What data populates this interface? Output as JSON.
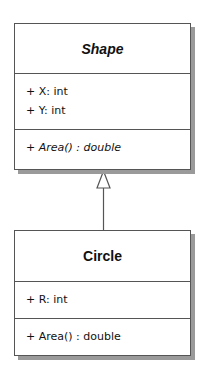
{
  "diagram": {
    "type": "UML class diagram",
    "classes": [
      {
        "name": "Shape",
        "abstract": true,
        "attributes": [
          "+ X: int",
          "+ Y: int"
        ],
        "operations": [
          "+ Area() : double"
        ]
      },
      {
        "name": "Circle",
        "abstract": false,
        "attributes": [
          "+ R: int"
        ],
        "operations": [
          "+ Area() : double"
        ]
      }
    ],
    "relationships": [
      {
        "type": "generalization",
        "from": "Circle",
        "to": "Shape"
      }
    ],
    "colors": {
      "border": "#555555",
      "shadow": "#9a9a9a",
      "background": "#ffffff",
      "text": "#111111"
    }
  }
}
